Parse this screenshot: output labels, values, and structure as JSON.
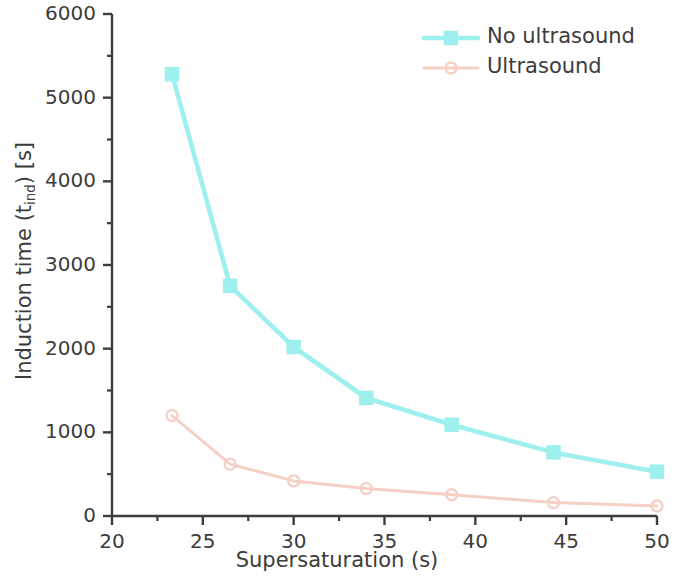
{
  "chart_data": {
    "type": "line",
    "title": "",
    "xlabel": "Supersaturation (s)",
    "ylabel_text": "Induction time (t",
    "ylabel_sub": "ind",
    "ylabel_tail": ") [s]",
    "ylabel_full": "Induction time (t_ind) [s]",
    "xlim": [
      20,
      50
    ],
    "ylim": [
      0,
      6000
    ],
    "xticks": [
      20,
      25,
      30,
      35,
      40,
      45,
      50
    ],
    "xtick_labels": [
      "20",
      "25",
      "30",
      "35",
      "40",
      "45",
      "50"
    ],
    "xminor_step": 2.5,
    "yticks": [
      0,
      1000,
      2000,
      3000,
      4000,
      5000,
      6000
    ],
    "ytick_labels": [
      "0",
      "1000",
      "2000",
      "3000",
      "4000",
      "5000",
      "6000"
    ],
    "yminor_step": 500,
    "grid": false,
    "legend_position": "top-right",
    "x": [
      23.3,
      26.5,
      30.0,
      34.0,
      38.7,
      44.3,
      50.0
    ],
    "series": [
      {
        "name": "No ultrasound",
        "color": "#9ef0ee",
        "marker": "square",
        "values": [
          5280,
          2750,
          2020,
          1410,
          1090,
          760,
          530
        ]
      },
      {
        "name": "Ultrasound",
        "color": "#f6cfc6",
        "marker": "circle",
        "values": [
          1200,
          620,
          420,
          330,
          255,
          160,
          120
        ]
      }
    ]
  },
  "legend": {
    "entries": [
      {
        "label": "No ultrasound"
      },
      {
        "label": "Ultrasound"
      }
    ]
  },
  "style": {
    "axis_color": "#3c3c3c",
    "text_color": "#3c3c3c",
    "background": "#ffffff"
  }
}
